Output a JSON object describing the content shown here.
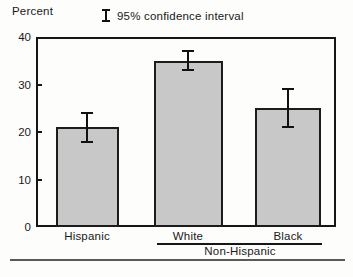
{
  "header": {
    "y_axis_title": "Percent",
    "legend_label": "95% confidence interval"
  },
  "chart_data": {
    "type": "bar",
    "title": "",
    "xlabel": "",
    "ylabel": "Percent",
    "ylim": [
      0,
      40
    ],
    "yticks": [
      0,
      10,
      20,
      30,
      40
    ],
    "grid": false,
    "legend_note": "95% confidence interval",
    "categories": [
      "Hispanic",
      "White",
      "Black"
    ],
    "values": [
      21,
      35,
      25
    ],
    "ci_low": [
      18,
      33,
      21
    ],
    "ci_high": [
      24,
      37,
      29
    ],
    "group_labels": [
      {
        "label": "Non-Hispanic",
        "spans": [
          "White",
          "Black"
        ]
      }
    ],
    "bar_fill_color": "#c8c8c8",
    "bar_border_color": "#1c1c1c",
    "error_bar_color": "#111111"
  }
}
